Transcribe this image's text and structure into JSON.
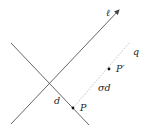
{
  "diagram": {
    "colors": {
      "line": "#555555",
      "dotted": "#bbbbbb",
      "point": "#111111",
      "text": "#222222",
      "background": "#ffffff"
    },
    "labels": {
      "line_l": "ℓ",
      "line_q": "q",
      "point_p": "P",
      "point_p_prime": "P′",
      "distance_d": "d",
      "distance_sigma_d": "σd"
    },
    "lines": [
      {
        "name": "line-l",
        "from": [
          11,
          124
        ],
        "to": [
          120,
          9
        ],
        "arrow": true
      },
      {
        "name": "crossing-line",
        "from": [
          11,
          43
        ],
        "to": [
          89,
          125
        ],
        "arrow": false
      },
      {
        "name": "line-q",
        "from": [
          73,
          108
        ],
        "to": [
          130,
          42
        ],
        "dotted": true
      }
    ],
    "points": [
      {
        "name": "P",
        "at": [
          73,
          108
        ]
      },
      {
        "name": "P'",
        "at": [
          109,
          69
        ]
      }
    ]
  }
}
